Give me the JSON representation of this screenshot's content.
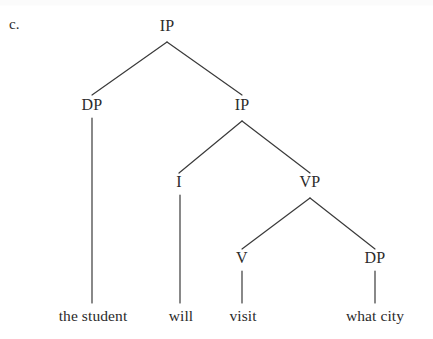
{
  "figure": {
    "item_label": "c.",
    "colors": {
      "ink": "#2b2b2b",
      "line": "#3a3a3a",
      "background": "#ffffff"
    }
  },
  "tree": {
    "nodes": [
      {
        "id": "ip-root",
        "label": "IP",
        "x": 167,
        "y": 26
      },
      {
        "id": "dp-subj",
        "label": "DP",
        "x": 92,
        "y": 105
      },
      {
        "id": "ip-inner",
        "label": "IP",
        "x": 242,
        "y": 105
      },
      {
        "id": "i-head",
        "label": "I",
        "x": 179,
        "y": 182
      },
      {
        "id": "vp",
        "label": "VP",
        "x": 310,
        "y": 182
      },
      {
        "id": "v-head",
        "label": "V",
        "x": 242,
        "y": 258
      },
      {
        "id": "dp-obj",
        "label": "DP",
        "x": 375,
        "y": 258
      }
    ],
    "leaves": [
      {
        "id": "leaf-subject",
        "label": "the student",
        "x": 93,
        "y": 316
      },
      {
        "id": "leaf-will",
        "label": "will",
        "x": 181,
        "y": 316
      },
      {
        "id": "leaf-visit",
        "label": "visit",
        "x": 243,
        "y": 316
      },
      {
        "id": "leaf-object",
        "label": "what city",
        "x": 375,
        "y": 316
      }
    ],
    "branches": [
      {
        "id": "ip-root-to-dp-subj",
        "x1": 167,
        "y1": 42,
        "x2": 92,
        "y2": 95
      },
      {
        "id": "ip-root-to-ip-inner",
        "x1": 167,
        "y1": 42,
        "x2": 242,
        "y2": 95
      },
      {
        "id": "ip-inner-to-i",
        "x1": 242,
        "y1": 121,
        "x2": 179,
        "y2": 173
      },
      {
        "id": "ip-inner-to-vp",
        "x1": 242,
        "y1": 121,
        "x2": 310,
        "y2": 173
      },
      {
        "id": "vp-to-v",
        "x1": 310,
        "y1": 198,
        "x2": 242,
        "y2": 249
      },
      {
        "id": "vp-to-dp-obj",
        "x1": 310,
        "y1": 198,
        "x2": 375,
        "y2": 249
      },
      {
        "id": "dp-subj-to-leaf",
        "x1": 92,
        "y1": 118,
        "x2": 92,
        "y2": 303
      },
      {
        "id": "i-to-leaf",
        "x1": 180,
        "y1": 195,
        "x2": 180,
        "y2": 303
      },
      {
        "id": "v-to-leaf",
        "x1": 242,
        "y1": 271,
        "x2": 242,
        "y2": 303
      },
      {
        "id": "dp-obj-to-leaf",
        "x1": 375,
        "y1": 271,
        "x2": 375,
        "y2": 303
      }
    ]
  }
}
